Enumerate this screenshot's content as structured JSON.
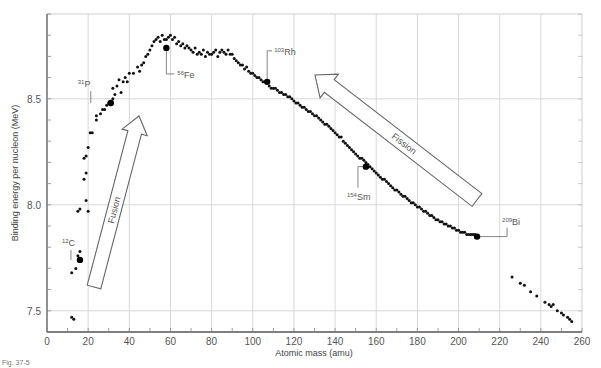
{
  "chart_data": {
    "type": "scatter",
    "title": "",
    "xlabel": "Atomic mass (amu)",
    "ylabel": "Binding energy per nucleon (MeV)",
    "xlim": [
      0,
      260
    ],
    "ylim": [
      7.4,
      8.9
    ],
    "x_ticks": [
      0,
      20,
      40,
      60,
      80,
      100,
      120,
      140,
      160,
      180,
      200,
      220,
      240,
      260
    ],
    "y_ticks": [
      7.5,
      8.0,
      8.5
    ],
    "x_minor_step": 10,
    "y_minor_step": 0.1,
    "grid": true,
    "legend": null,
    "highlighted_points": [
      {
        "label": "12C",
        "mass_number": "12",
        "symbol": "C",
        "x": 16,
        "y": 7.74
      },
      {
        "label": "31P",
        "mass_number": "31",
        "symbol": "P",
        "x": 31,
        "y": 8.48
      },
      {
        "label": "56Fe",
        "mass_number": "56",
        "symbol": "Fe",
        "x": 58,
        "y": 8.74
      },
      {
        "label": "103Rh",
        "mass_number": "103",
        "symbol": "Rh",
        "x": 107,
        "y": 8.58
      },
      {
        "label": "154Sm",
        "mass_number": "154",
        "symbol": "Sm",
        "x": 155,
        "y": 8.18
      },
      {
        "label": "209Bi",
        "mass_number": "209",
        "symbol": "Bi",
        "x": 209,
        "y": 7.85
      }
    ],
    "series": [
      {
        "name": "nuclides",
        "points": [
          [
            12,
            7.47
          ],
          [
            13,
            7.46
          ],
          [
            12,
            7.68
          ],
          [
            14,
            7.7
          ],
          [
            15,
            7.76
          ],
          [
            16,
            7.78
          ],
          [
            15,
            7.97
          ],
          [
            16,
            7.98
          ],
          [
            19,
            8.02
          ],
          [
            20,
            7.97
          ],
          [
            18,
            8.12
          ],
          [
            19,
            8.15
          ],
          [
            18,
            8.22
          ],
          [
            19,
            8.23
          ],
          [
            20,
            8.27
          ],
          [
            21,
            8.34
          ],
          [
            22,
            8.34
          ],
          [
            24,
            8.4
          ],
          [
            24,
            8.42
          ],
          [
            26,
            8.43
          ],
          [
            27,
            8.45
          ],
          [
            28,
            8.45
          ],
          [
            29,
            8.47
          ],
          [
            30,
            8.48
          ],
          [
            32,
            8.5
          ],
          [
            33,
            8.52
          ],
          [
            32,
            8.55
          ],
          [
            34,
            8.56
          ],
          [
            36,
            8.53
          ],
          [
            35,
            8.59
          ],
          [
            37,
            8.58
          ],
          [
            38,
            8.6
          ],
          [
            39,
            8.58
          ],
          [
            40,
            8.62
          ],
          [
            42,
            8.62
          ],
          [
            44,
            8.65
          ],
          [
            45,
            8.63
          ],
          [
            46,
            8.66
          ],
          [
            47,
            8.67
          ],
          [
            48,
            8.7
          ],
          [
            49,
            8.71
          ],
          [
            50,
            8.73
          ],
          [
            51,
            8.75
          ],
          [
            52,
            8.77
          ],
          [
            53,
            8.78
          ],
          [
            54,
            8.79
          ],
          [
            55,
            8.77
          ],
          [
            56,
            8.8
          ],
          [
            57,
            8.78
          ],
          [
            58,
            8.78
          ],
          [
            59,
            8.79
          ],
          [
            60,
            8.8
          ],
          [
            61,
            8.78
          ],
          [
            62,
            8.79
          ],
          [
            63,
            8.76
          ],
          [
            64,
            8.77
          ],
          [
            65,
            8.75
          ],
          [
            66,
            8.76
          ],
          [
            67,
            8.74
          ],
          [
            68,
            8.75
          ],
          [
            69,
            8.74
          ],
          [
            70,
            8.73
          ],
          [
            71,
            8.72
          ],
          [
            72,
            8.74
          ],
          [
            73,
            8.71
          ],
          [
            74,
            8.72
          ],
          [
            75,
            8.71
          ],
          [
            76,
            8.73
          ],
          [
            77,
            8.7
          ],
          [
            78,
            8.72
          ],
          [
            79,
            8.71
          ],
          [
            80,
            8.71
          ],
          [
            81,
            8.72
          ],
          [
            82,
            8.73
          ],
          [
            83,
            8.7
          ],
          [
            84,
            8.72
          ],
          [
            85,
            8.73
          ],
          [
            86,
            8.72
          ],
          [
            87,
            8.71
          ],
          [
            88,
            8.73
          ],
          [
            89,
            8.71
          ],
          [
            90,
            8.71
          ],
          [
            91,
            8.69
          ],
          [
            92,
            8.68
          ],
          [
            93,
            8.67
          ],
          [
            94,
            8.66
          ],
          [
            95,
            8.66
          ],
          [
            96,
            8.64
          ],
          [
            97,
            8.65
          ],
          [
            98,
            8.63
          ],
          [
            99,
            8.62
          ],
          [
            100,
            8.62
          ],
          [
            101,
            8.61
          ],
          [
            102,
            8.6
          ],
          [
            103,
            8.6
          ],
          [
            104,
            8.59
          ],
          [
            105,
            8.58
          ],
          [
            106,
            8.58
          ],
          [
            107,
            8.58
          ],
          [
            108,
            8.56
          ],
          [
            109,
            8.55
          ],
          [
            110,
            8.55
          ],
          [
            111,
            8.55
          ],
          [
            112,
            8.54
          ],
          [
            113,
            8.53
          ],
          [
            114,
            8.53
          ],
          [
            115,
            8.52
          ],
          [
            116,
            8.52
          ],
          [
            117,
            8.51
          ],
          [
            118,
            8.51
          ],
          [
            119,
            8.5
          ],
          [
            120,
            8.49
          ],
          [
            121,
            8.48
          ],
          [
            122,
            8.48
          ],
          [
            123,
            8.47
          ],
          [
            124,
            8.46
          ],
          [
            125,
            8.46
          ],
          [
            126,
            8.45
          ],
          [
            127,
            8.44
          ],
          [
            128,
            8.44
          ],
          [
            129,
            8.43
          ],
          [
            130,
            8.42
          ],
          [
            131,
            8.42
          ],
          [
            132,
            8.41
          ],
          [
            133,
            8.4
          ],
          [
            134,
            8.39
          ],
          [
            135,
            8.38
          ],
          [
            136,
            8.38
          ],
          [
            137,
            8.37
          ],
          [
            138,
            8.36
          ],
          [
            139,
            8.35
          ],
          [
            140,
            8.34
          ],
          [
            141,
            8.33
          ],
          [
            142,
            8.32
          ],
          [
            143,
            8.32
          ],
          [
            144,
            8.3
          ],
          [
            145,
            8.29
          ],
          [
            146,
            8.28
          ],
          [
            147,
            8.27
          ],
          [
            148,
            8.26
          ],
          [
            149,
            8.25
          ],
          [
            150,
            8.24
          ],
          [
            151,
            8.23
          ],
          [
            152,
            8.22
          ],
          [
            153,
            8.22
          ],
          [
            154,
            8.21
          ],
          [
            155,
            8.2
          ],
          [
            156,
            8.19
          ],
          [
            157,
            8.18
          ],
          [
            158,
            8.17
          ],
          [
            159,
            8.16
          ],
          [
            160,
            8.15
          ],
          [
            161,
            8.14
          ],
          [
            162,
            8.13
          ],
          [
            163,
            8.12
          ],
          [
            164,
            8.12
          ],
          [
            165,
            8.11
          ],
          [
            166,
            8.1
          ],
          [
            167,
            8.09
          ],
          [
            168,
            8.08
          ],
          [
            169,
            8.07
          ],
          [
            170,
            8.07
          ],
          [
            171,
            8.06
          ],
          [
            172,
            8.05
          ],
          [
            173,
            8.04
          ],
          [
            174,
            8.04
          ],
          [
            175,
            8.03
          ],
          [
            176,
            8.02
          ],
          [
            177,
            8.01
          ],
          [
            178,
            8.01
          ],
          [
            179,
            8.0
          ],
          [
            180,
            7.99
          ],
          [
            181,
            7.99
          ],
          [
            182,
            7.98
          ],
          [
            183,
            7.97
          ],
          [
            184,
            7.97
          ],
          [
            185,
            7.96
          ],
          [
            186,
            7.95
          ],
          [
            187,
            7.95
          ],
          [
            188,
            7.94
          ],
          [
            189,
            7.93
          ],
          [
            190,
            7.93
          ],
          [
            191,
            7.92
          ],
          [
            192,
            7.92
          ],
          [
            193,
            7.91
          ],
          [
            194,
            7.91
          ],
          [
            195,
            7.9
          ],
          [
            196,
            7.9
          ],
          [
            197,
            7.89
          ],
          [
            198,
            7.89
          ],
          [
            199,
            7.88
          ],
          [
            200,
            7.88
          ],
          [
            201,
            7.87
          ],
          [
            202,
            7.87
          ],
          [
            203,
            7.87
          ],
          [
            204,
            7.86
          ],
          [
            205,
            7.86
          ],
          [
            206,
            7.86
          ],
          [
            207,
            7.86
          ],
          [
            208,
            7.86
          ],
          [
            226,
            7.66
          ],
          [
            230,
            7.63
          ],
          [
            232,
            7.62
          ],
          [
            235,
            7.59
          ],
          [
            238,
            7.57
          ],
          [
            242,
            7.54
          ],
          [
            244,
            7.53
          ],
          [
            245,
            7.52
          ],
          [
            246,
            7.53
          ],
          [
            248,
            7.5
          ],
          [
            250,
            7.49
          ],
          [
            251,
            7.48
          ],
          [
            253,
            7.47
          ],
          [
            254,
            7.46
          ],
          [
            255,
            7.45
          ]
        ]
      }
    ],
    "annotations": [
      {
        "text": "Fusion",
        "type": "arrow",
        "direction": "up-right",
        "from": [
          24,
          7.6
        ],
        "to": [
          45,
          8.43
        ]
      },
      {
        "text": "Fission",
        "type": "arrow",
        "direction": "up-left",
        "from": [
          210,
          7.98
        ],
        "to": [
          130,
          8.6
        ]
      }
    ]
  },
  "labels": {
    "xlabel": "Atomic mass (amu)",
    "ylabel": "Binding energy per nucleon (MeV)",
    "fusion": "Fusion",
    "fission": "Fission",
    "caption": "Fig. 37-5"
  }
}
